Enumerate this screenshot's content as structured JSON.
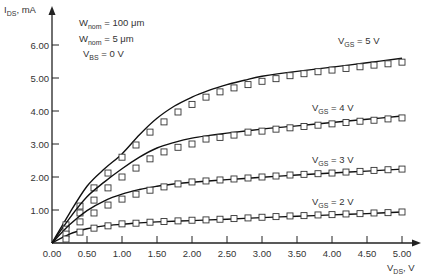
{
  "chart_data": {
    "type": "line",
    "title": "",
    "xlabel": "V_DS, V",
    "ylabel": "I_DS, mA",
    "xlabel_parts": {
      "main": "V",
      "sub": "DS",
      "unit": ", V"
    },
    "ylabel_parts": {
      "main": "I",
      "sub": "DS",
      "unit": ", mA"
    },
    "xlim": [
      0,
      5.0
    ],
    "ylim": [
      0,
      6.5
    ],
    "grid": false,
    "x_ticks": [
      "0.00",
      "0.50",
      "1.00",
      "1.50",
      "2.00",
      "2.50",
      "3.00",
      "3.50",
      "4.00",
      "4.50",
      "5.00"
    ],
    "x_tick_values": [
      0,
      0.5,
      1.0,
      1.5,
      2.0,
      2.5,
      3.0,
      3.5,
      4.0,
      4.5,
      5.0
    ],
    "y_ticks": [
      "1.00",
      "2.00",
      "3.00",
      "4.00",
      "5.00",
      "6.00"
    ],
    "y_tick_values": [
      1,
      2,
      3,
      4,
      5,
      6
    ],
    "annotations": [
      {
        "main": "W",
        "sub": "nom",
        "rest": " = 100 μm"
      },
      {
        "main": "W",
        "sub": "nom",
        "rest": " = 5 μm"
      },
      {
        "main": "V",
        "sub": "BS",
        "rest": " = 0 V"
      }
    ],
    "legend": {
      "model": "solid line (model)",
      "measured": "open squares (measured)"
    },
    "series": [
      {
        "name": "V_GS = 5 V",
        "label_parts": {
          "main": "V",
          "sub": "GS",
          "rest": " = 5 V"
        },
        "label_pos": [
          338,
          44
        ],
        "model": {
          "x": [
            0,
            0.25,
            0.5,
            0.75,
            1.0,
            1.25,
            1.5,
            1.75,
            2.0,
            2.25,
            2.5,
            2.75,
            3.0,
            3.5,
            4.0,
            4.5,
            5.0
          ],
          "y": [
            0,
            0.9,
            1.72,
            2.25,
            2.7,
            3.28,
            3.78,
            4.15,
            4.42,
            4.63,
            4.8,
            4.93,
            5.05,
            5.2,
            5.33,
            5.46,
            5.6
          ]
        },
        "measured": {
          "x": [
            0.2,
            0.4,
            0.6,
            0.8,
            1.0,
            1.2,
            1.4,
            1.6,
            1.8,
            2.0,
            2.2,
            2.4,
            2.6,
            2.8,
            3.0,
            3.2,
            3.4,
            3.6,
            3.8,
            4.0,
            4.2,
            4.4,
            4.6,
            4.8,
            5.0
          ],
          "y": [
            0.55,
            1.12,
            1.67,
            2.12,
            2.6,
            2.97,
            3.36,
            3.67,
            3.97,
            4.2,
            4.42,
            4.58,
            4.7,
            4.8,
            4.9,
            4.98,
            5.07,
            5.13,
            5.19,
            5.24,
            5.29,
            5.34,
            5.39,
            5.43,
            5.48
          ]
        }
      },
      {
        "name": "V_GS = 4 V",
        "label_parts": {
          "main": "V",
          "sub": "GS",
          "rest": " = 4 V"
        },
        "label_pos": [
          312,
          111
        ],
        "model": {
          "x": [
            0,
            0.25,
            0.5,
            0.75,
            1.0,
            1.25,
            1.5,
            1.75,
            2.0,
            2.25,
            2.5,
            3.0,
            3.5,
            4.0,
            4.5,
            5.0
          ],
          "y": [
            0,
            0.75,
            1.4,
            1.85,
            2.25,
            2.6,
            2.88,
            3.05,
            3.18,
            3.26,
            3.33,
            3.45,
            3.55,
            3.65,
            3.75,
            3.85
          ]
        },
        "measured": {
          "x": [
            0.2,
            0.4,
            0.6,
            0.8,
            1.0,
            1.2,
            1.4,
            1.6,
            1.8,
            2.0,
            2.2,
            2.4,
            2.6,
            2.8,
            3.0,
            3.2,
            3.4,
            3.6,
            3.8,
            4.0,
            4.2,
            4.4,
            4.6,
            4.8,
            5.0
          ],
          "y": [
            0.42,
            0.91,
            1.3,
            1.67,
            2.0,
            2.27,
            2.55,
            2.76,
            2.9,
            3.0,
            3.15,
            3.2,
            3.27,
            3.36,
            3.39,
            3.45,
            3.49,
            3.53,
            3.57,
            3.61,
            3.65,
            3.69,
            3.72,
            3.76,
            3.79
          ]
        }
      },
      {
        "name": "V_GS = 3 V",
        "label_parts": {
          "main": "V",
          "sub": "GS",
          "rest": " = 3 V"
        },
        "label_pos": [
          312,
          163
        ],
        "model": {
          "x": [
            0,
            0.25,
            0.5,
            0.75,
            1.0,
            1.25,
            1.5,
            1.75,
            2.0,
            2.5,
            3.0,
            3.5,
            4.0,
            4.5,
            5.0
          ],
          "y": [
            0,
            0.55,
            0.98,
            1.28,
            1.48,
            1.62,
            1.72,
            1.79,
            1.84,
            1.92,
            1.99,
            2.06,
            2.12,
            2.18,
            2.24
          ]
        },
        "measured": {
          "x": [
            0.2,
            0.4,
            0.6,
            0.8,
            1.0,
            1.2,
            1.4,
            1.6,
            1.8,
            2.0,
            2.2,
            2.4,
            2.6,
            2.8,
            3.0,
            3.2,
            3.4,
            3.6,
            3.8,
            4.0,
            4.2,
            4.4,
            4.6,
            4.8,
            5.0
          ],
          "y": [
            0.27,
            0.64,
            0.91,
            1.15,
            1.33,
            1.48,
            1.6,
            1.7,
            1.79,
            1.85,
            1.88,
            1.91,
            1.94,
            1.97,
            2.0,
            2.03,
            2.06,
            2.08,
            2.1,
            2.12,
            2.15,
            2.17,
            2.2,
            2.22,
            2.24
          ]
        }
      },
      {
        "name": "V_GS = 2 V",
        "label_parts": {
          "main": "V",
          "sub": "GS",
          "rest": " = 2 V"
        },
        "label_pos": [
          312,
          205
        ],
        "model": {
          "x": [
            0,
            0.25,
            0.5,
            0.75,
            1.0,
            1.25,
            1.5,
            2.0,
            2.5,
            3.0,
            3.5,
            4.0,
            4.5,
            5.0
          ],
          "y": [
            0,
            0.27,
            0.43,
            0.52,
            0.57,
            0.61,
            0.64,
            0.68,
            0.72,
            0.77,
            0.81,
            0.85,
            0.89,
            0.94
          ]
        },
        "measured": {
          "x": [
            0.2,
            0.4,
            0.6,
            0.8,
            1.0,
            1.2,
            1.4,
            1.6,
            1.8,
            2.0,
            2.2,
            2.4,
            2.6,
            2.8,
            3.0,
            3.2,
            3.4,
            3.6,
            3.8,
            4.0,
            4.2,
            4.4,
            4.6,
            4.8,
            5.0
          ],
          "y": [
            0.12,
            0.33,
            0.45,
            0.52,
            0.58,
            0.6,
            0.63,
            0.65,
            0.67,
            0.69,
            0.7,
            0.72,
            0.74,
            0.76,
            0.78,
            0.8,
            0.82,
            0.83,
            0.85,
            0.86,
            0.88,
            0.89,
            0.91,
            0.92,
            0.94
          ]
        }
      }
    ]
  }
}
